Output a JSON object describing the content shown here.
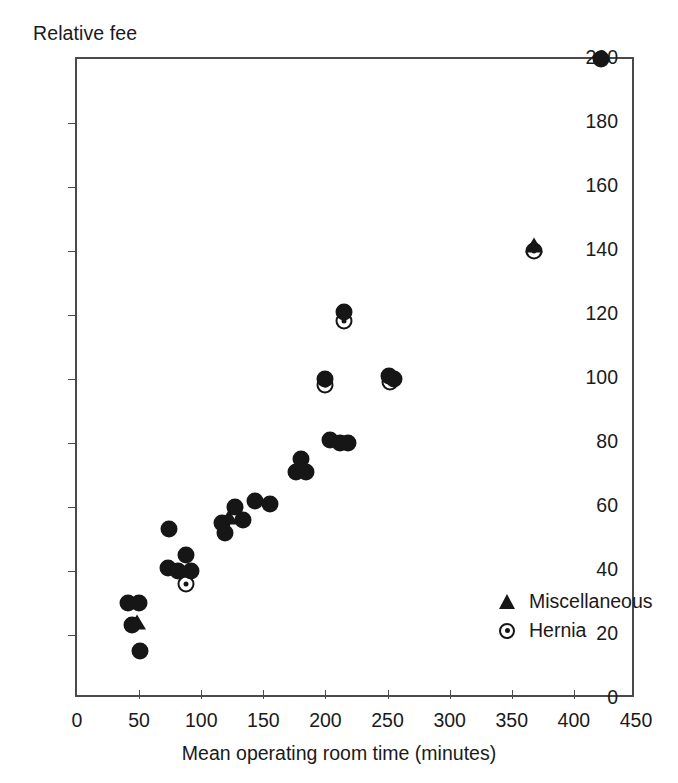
{
  "chart_data": {
    "type": "scatter",
    "title": "",
    "xlabel": "Mean operating room time (minutes)",
    "ylabel": "Relative fee",
    "xlim": [
      0,
      450
    ],
    "ylim": [
      0,
      200
    ],
    "xticks": [
      0,
      50,
      100,
      150,
      200,
      250,
      300,
      350,
      400,
      450
    ],
    "yticks": [
      0,
      20,
      40,
      60,
      80,
      100,
      120,
      140,
      160,
      180,
      200
    ],
    "xtick_labels": [
      "0",
      "50",
      "100",
      "150",
      "200",
      "250",
      "300",
      "350",
      "400",
      "450"
    ],
    "ytick_labels": [
      "0",
      "20",
      "40",
      "60",
      "80",
      "100",
      "120",
      "140",
      "160",
      "180",
      "200"
    ],
    "grid": false,
    "legend_position": "inside-right",
    "series": [
      {
        "name": "Other procedures",
        "marker": "filled-circle",
        "points": [
          {
            "x": 41,
            "y": 30
          },
          {
            "x": 50,
            "y": 30
          },
          {
            "x": 44,
            "y": 23
          },
          {
            "x": 51,
            "y": 15
          },
          {
            "x": 74,
            "y": 53
          },
          {
            "x": 73,
            "y": 41
          },
          {
            "x": 81,
            "y": 40
          },
          {
            "x": 88,
            "y": 45
          },
          {
            "x": 92,
            "y": 40
          },
          {
            "x": 117,
            "y": 55
          },
          {
            "x": 119,
            "y": 52
          },
          {
            "x": 127,
            "y": 60
          },
          {
            "x": 134,
            "y": 56
          },
          {
            "x": 143,
            "y": 62
          },
          {
            "x": 155,
            "y": 61
          },
          {
            "x": 176,
            "y": 71
          },
          {
            "x": 180,
            "y": 75
          },
          {
            "x": 184,
            "y": 71
          },
          {
            "x": 200,
            "y": 100
          },
          {
            "x": 204,
            "y": 81
          },
          {
            "x": 212,
            "y": 80
          },
          {
            "x": 215,
            "y": 121
          },
          {
            "x": 218,
            "y": 80
          },
          {
            "x": 251,
            "y": 101
          },
          {
            "x": 255,
            "y": 100
          },
          {
            "x": 422,
            "y": 200
          }
        ]
      },
      {
        "name": "Miscellaneous",
        "marker": "triangle",
        "points": [
          {
            "x": 48,
            "y": 24
          },
          {
            "x": 122,
            "y": 57
          },
          {
            "x": 368,
            "y": 142
          }
        ]
      },
      {
        "name": "Hernia",
        "marker": "circle-dot",
        "points": [
          {
            "x": 88,
            "y": 36
          },
          {
            "x": 200,
            "y": 98
          },
          {
            "x": 215,
            "y": 118
          },
          {
            "x": 252,
            "y": 99
          },
          {
            "x": 368,
            "y": 140
          }
        ]
      }
    ],
    "legend": [
      {
        "label": "Miscellaneous",
        "marker": "triangle"
      },
      {
        "label": "Hernia",
        "marker": "circle-dot"
      }
    ],
    "colors": {
      "marker": "#161616",
      "axis": "#4a4a4a",
      "text": "#1a1a1a",
      "background": "#ffffff"
    }
  }
}
